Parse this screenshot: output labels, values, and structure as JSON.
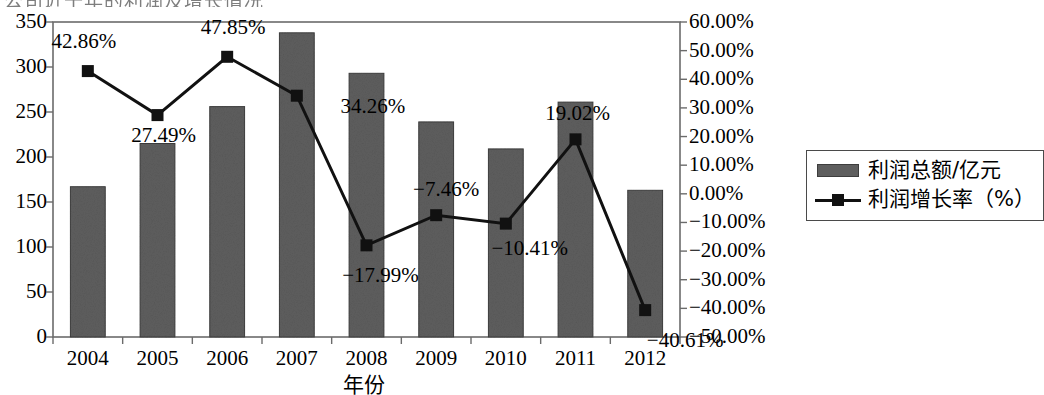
{
  "title_cropped": "公司近十年的利润及增长情况",
  "legend": {
    "bar_label": "利润总额/亿元",
    "line_label": "利润增长率（%）"
  },
  "axes": {
    "x_title": "年份",
    "x_ticks": [
      "2004",
      "2005",
      "2006",
      "2007",
      "2008",
      "2009",
      "2010",
      "2011",
      "2012"
    ],
    "y_left_ticks": [
      "350",
      "300",
      "250",
      "200",
      "150",
      "100",
      "50",
      "0"
    ],
    "y_right_ticks": [
      "60.00%",
      "50.00%",
      "40.00%",
      "30.00%",
      "20.00%",
      "10.00%",
      "0.00%",
      "-10.00%",
      "-20.00%",
      "-30.00%",
      "-40.00%",
      "-50.00%"
    ]
  },
  "colors": {
    "bar_fill": "#5e5e5e",
    "bar_edge": "#3d3d3d",
    "line": "#111111",
    "marker": "#111111",
    "axis": "#6b6b6b"
  },
  "chart_data": {
    "type": "bar",
    "title": "公司近十年的利润及增长情况",
    "xlabel": "年份",
    "ylabel": "",
    "categories": [
      "2004",
      "2005",
      "2006",
      "2007",
      "2008",
      "2009",
      "2010",
      "2011",
      "2012"
    ],
    "grid": false,
    "legend_position": "right",
    "ylim": [
      0,
      350
    ],
    "y2lim": [
      -50,
      60
    ],
    "series": [
      {
        "name": "利润总额/亿元",
        "type": "bar",
        "axis": "left",
        "values": [
          167,
          215,
          256,
          338,
          293,
          239,
          209,
          261,
          163
        ]
      },
      {
        "name": "利润增长率（%）",
        "type": "line",
        "axis": "right",
        "values": [
          42.86,
          27.49,
          47.85,
          34.26,
          -17.99,
          -7.46,
          -10.41,
          19.02,
          -40.61
        ],
        "labels": [
          "42.86%",
          "27.49%",
          "47.85%",
          "34.26%",
          "-17.99%",
          "-7.46%",
          "-10.41%",
          "19.02%",
          "-40.61%"
        ]
      }
    ]
  }
}
